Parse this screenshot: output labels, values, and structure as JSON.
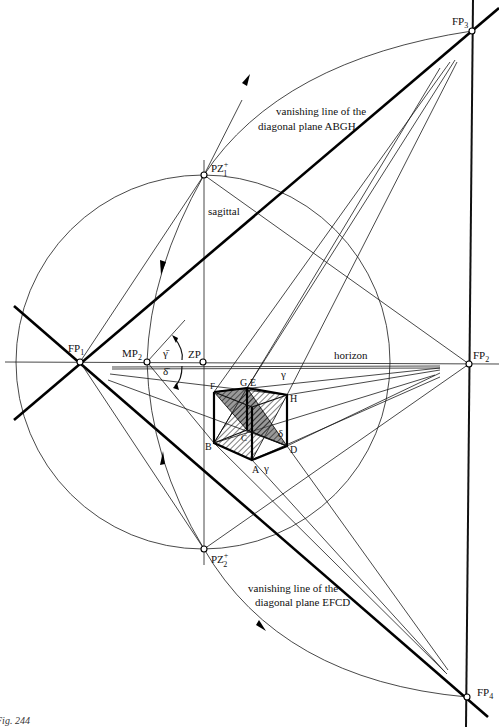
{
  "figure": {
    "caption": "Fig. 244",
    "background": "#ffffff",
    "ink": "#000000"
  },
  "points": {
    "fp1": {
      "label": "FP",
      "sub": "1"
    },
    "fp2": {
      "label": "FP",
      "sub": "2"
    },
    "fp3": {
      "label": "FP",
      "sub": "3"
    },
    "fp4": {
      "label": "FP",
      "sub": "4"
    },
    "mp2": {
      "label": "MP",
      "sub": "2"
    },
    "zp": {
      "label": "ZP"
    },
    "pz1": {
      "label": "PZ",
      "sub": "1",
      "sup": "+"
    },
    "pz2": {
      "label": "PZ",
      "sub": "2",
      "sup": "+"
    }
  },
  "lines": {
    "horizon": "horizon",
    "sagittal": "sagittal"
  },
  "annotations": {
    "abgh_line1": "vanishing line of the",
    "abgh_line2": "diagonal plane ABGH",
    "efcd_line1": "vanishing line of the",
    "efcd_line2": "diagonal plane EFCD"
  },
  "angles": {
    "gamma_bar": "γ̄",
    "delta_bar": "δ̄",
    "gamma_top": "γ",
    "gamma_bottom": "γ",
    "delta_cube": "δ"
  },
  "cube_vertices": {
    "a": "A",
    "b": "B",
    "c": "C",
    "d": "D",
    "e": "E",
    "f": "F",
    "g": "G",
    "h": "H"
  }
}
